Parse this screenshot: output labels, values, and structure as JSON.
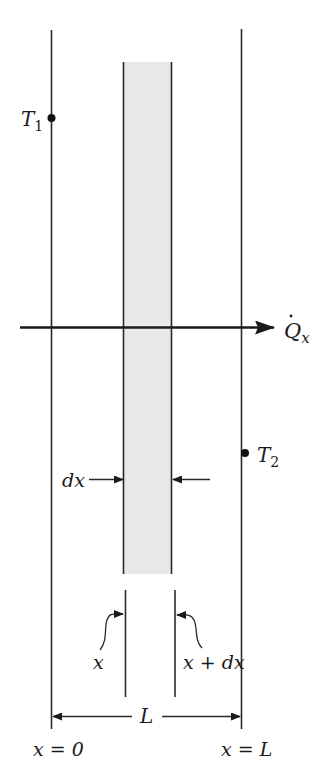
{
  "diagram": {
    "title": "",
    "type": "one-dimensional plane wall heat conduction",
    "colors": {
      "line": "#2a2a2a",
      "strip_fill": "#e8e8e8",
      "background": "#ffffff"
    },
    "labels": {
      "t1": "T",
      "t1_sub": "1",
      "t2": "T",
      "t2_sub": "2",
      "heat_flow": "Q",
      "heat_flow_dot": "˙",
      "heat_flow_sub": "x",
      "element_width": "dx",
      "left_face": "x",
      "right_face": "x + dx",
      "length": "L",
      "left_boundary": "x = 0",
      "right_boundary": "x = L"
    }
  }
}
